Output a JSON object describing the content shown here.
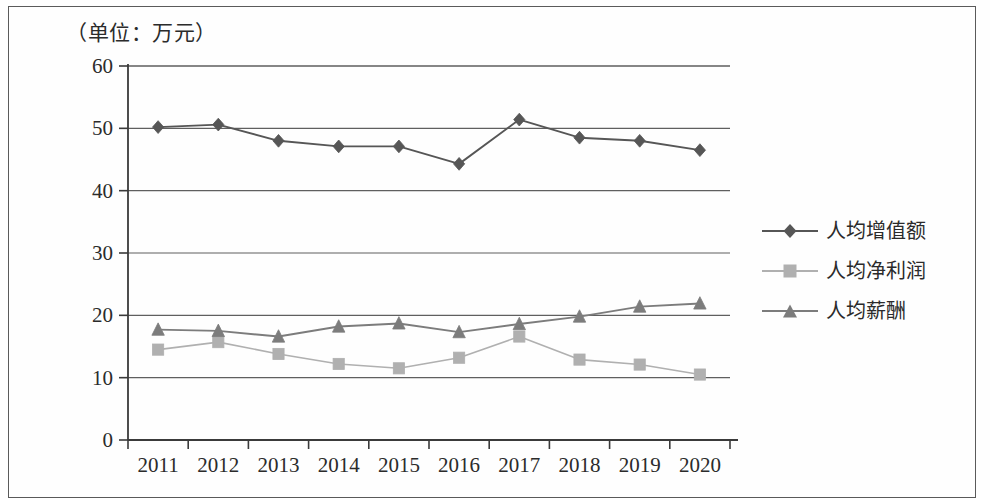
{
  "figure": {
    "unit_note": "（单位：万元）"
  },
  "chart_data": {
    "type": "line",
    "title": "（单位：万元）",
    "xlabel": "",
    "ylabel": "",
    "ylim": [
      0,
      60
    ],
    "ytick_step": 10,
    "yticks": [
      "0",
      "10",
      "20",
      "30",
      "40",
      "50",
      "60"
    ],
    "grid": true,
    "legend_position": "right",
    "categories": [
      "2011",
      "2012",
      "2013",
      "2014",
      "2015",
      "2016",
      "2017",
      "2018",
      "2019",
      "2020"
    ],
    "series": [
      {
        "name": "人均增值额",
        "marker": "diamond",
        "color": "#565656",
        "values": [
          50.2,
          50.6,
          48.0,
          47.1,
          47.1,
          44.3,
          51.4,
          48.5,
          48.0,
          46.5
        ]
      },
      {
        "name": "人均净利润",
        "marker": "square",
        "color": "#b0b0b0",
        "values": [
          14.5,
          15.7,
          13.8,
          12.2,
          11.5,
          13.2,
          16.6,
          12.9,
          12.1,
          10.5
        ]
      },
      {
        "name": "人均薪酬",
        "marker": "triangle",
        "color": "#7c7c7c",
        "values": [
          17.7,
          17.5,
          16.6,
          18.2,
          18.7,
          17.3,
          18.6,
          19.8,
          21.4,
          21.9
        ]
      }
    ]
  },
  "legend": {
    "items": [
      {
        "label": "人均增值额",
        "marker": "diamond-marker-icon",
        "color": "#565656"
      },
      {
        "label": "人均净利润",
        "marker": "square-marker-icon",
        "color": "#b0b0b0"
      },
      {
        "label": "人均薪酬",
        "marker": "triangle-marker-icon",
        "color": "#7c7c7c"
      }
    ]
  },
  "axes": {
    "y_ticks": [
      "60",
      "50",
      "40",
      "30",
      "20",
      "10",
      "0"
    ],
    "x_ticks": [
      "2011",
      "2012",
      "2013",
      "2014",
      "2015",
      "2016",
      "2017",
      "2018",
      "2019",
      "2020"
    ]
  }
}
